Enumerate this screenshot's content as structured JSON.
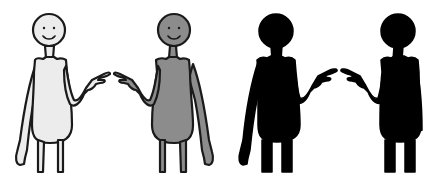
{
  "scene": {
    "background": "#ffffff",
    "figures": [
      {
        "id": "figure-light",
        "fill": "#ececec",
        "stroke": "#1a1a1a",
        "face": true,
        "points": "right"
      },
      {
        "id": "figure-grey",
        "fill": "#8c8c8c",
        "stroke": "#1a1a1a",
        "face": true,
        "points": "left"
      },
      {
        "id": "figure-black-left",
        "fill": "#000000",
        "stroke": "#000000",
        "face": false,
        "points": "right"
      },
      {
        "id": "figure-black-right",
        "fill": "#000000",
        "stroke": "#000000",
        "face": false,
        "points": "left"
      }
    ]
  }
}
